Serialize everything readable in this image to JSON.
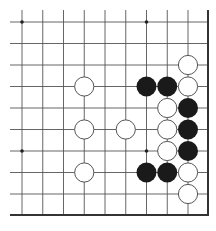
{
  "diagram": {
    "type": "go-board-fragment",
    "grid": {
      "cols": 9,
      "rows": 9,
      "x0": 22,
      "dx": 20.75,
      "y0": 22,
      "dy": 21.5,
      "left_extent": 10,
      "top_extent": 10,
      "right_edge": 208,
      "bottom_edge": 215,
      "line_color": "#555555",
      "edge_color": "#333333"
    },
    "star_points": [
      [
        0,
        0
      ],
      [
        6,
        0
      ],
      [
        0,
        6
      ],
      [
        6,
        6
      ]
    ],
    "stones": [
      {
        "color": "white",
        "col": 8,
        "row": 2
      },
      {
        "color": "white",
        "col": 3,
        "row": 3
      },
      {
        "color": "black",
        "col": 6,
        "row": 3
      },
      {
        "color": "black",
        "col": 7,
        "row": 3
      },
      {
        "color": "white",
        "col": 8,
        "row": 3
      },
      {
        "color": "white",
        "col": 7,
        "row": 4
      },
      {
        "color": "black",
        "col": 8,
        "row": 4
      },
      {
        "color": "white",
        "col": 3,
        "row": 5
      },
      {
        "color": "white",
        "col": 5,
        "row": 5
      },
      {
        "color": "white",
        "col": 7,
        "row": 5
      },
      {
        "color": "black",
        "col": 8,
        "row": 5
      },
      {
        "color": "white",
        "col": 7,
        "row": 6
      },
      {
        "color": "black",
        "col": 8,
        "row": 6
      },
      {
        "color": "white",
        "col": 3,
        "row": 7
      },
      {
        "color": "black",
        "col": 6,
        "row": 7
      },
      {
        "color": "black",
        "col": 7,
        "row": 7
      },
      {
        "color": "white",
        "col": 8,
        "row": 7
      },
      {
        "color": "white",
        "col": 8,
        "row": 8
      }
    ],
    "colors": {
      "black_stone": "#1a1a1a",
      "white_stone": "#ffffff",
      "white_outline": "#555555"
    }
  }
}
